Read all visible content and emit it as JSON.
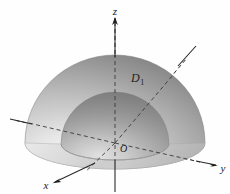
{
  "figure": {
    "background_color": "#fefefe",
    "axis_color": "#2a2a2a",
    "surface_light": "#f2f2f2",
    "surface_mid": "#b9b9b9",
    "surface_dark": "#7c7c7c",
    "inner_dark": "#8c8c8c"
  },
  "axes": {
    "z": {
      "label": "z",
      "direction": "up",
      "arrow": true,
      "dashed_inside_solid": "mixed"
    },
    "y": {
      "label": "y",
      "direction": "right",
      "arrow": true,
      "dashed_inside_solid": "mixed"
    },
    "x": {
      "label": "x",
      "direction": "lower-left",
      "arrow": true,
      "dashed_inside_solid": "mixed"
    },
    "origin": {
      "label": "O"
    }
  },
  "region": {
    "label": "D",
    "subscript": "1",
    "description": "hemispherical shell between inner and outer radius"
  }
}
